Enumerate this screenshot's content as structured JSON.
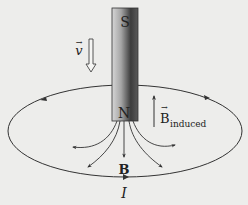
{
  "diagram": {
    "colors": {
      "background": "#ededeb",
      "line": "#333333",
      "magnet_light": "#d8d8d8",
      "magnet_dark": "#3a3a3a"
    },
    "magnet": {
      "top_pole": "S",
      "bottom_pole": "N"
    },
    "velocity": {
      "symbol": "v",
      "vector_arrow": "→",
      "direction": "down"
    },
    "induced_field": {
      "symbol": "B",
      "subscript": "induced",
      "vector_arrow": "→",
      "direction": "up"
    },
    "magnet_field": {
      "symbol": "B",
      "direction": "down"
    },
    "current": {
      "symbol": "I"
    },
    "loop": {
      "shape": "ellipse",
      "current_direction": "counterclockwise-from-above"
    }
  }
}
